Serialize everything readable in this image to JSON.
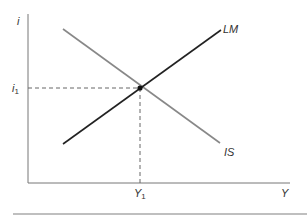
{
  "diagram": {
    "axes": {
      "y_label": "i",
      "x_label": "Y"
    },
    "curves": [
      {
        "name": "LM",
        "label": "LM",
        "color": "#222222",
        "from": [
          63,
          144
        ],
        "to": [
          221,
          30
        ]
      },
      {
        "name": "IS",
        "label": "IS",
        "color": "#888888",
        "from": [
          63,
          29
        ],
        "to": [
          220,
          143
        ]
      }
    ],
    "equilibrium": {
      "i_label": "i",
      "i_sub": "1",
      "y_label": "Y",
      "y_sub": "1",
      "point": [
        140,
        88
      ]
    }
  }
}
